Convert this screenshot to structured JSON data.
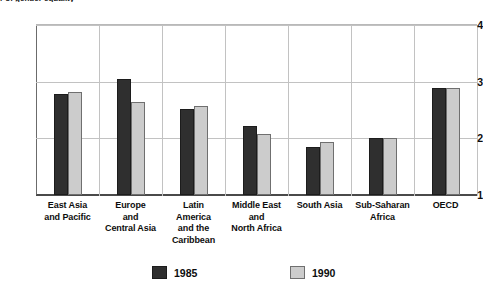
{
  "title_clipped": "r of gender equality",
  "legend": {
    "position": "bottom",
    "entries": [
      {
        "name": "1985",
        "swatch": "dark-gray",
        "color": "#2f2f2f"
      },
      {
        "name": "1990",
        "swatch": "light-gray",
        "color": "#cccccc"
      }
    ]
  },
  "axis": {
    "y_ticks": [
      "4",
      "3",
      "2",
      "1"
    ],
    "y_min": 1,
    "y_max": 4
  },
  "chart_data": {
    "type": "bar",
    "title": "r of gender equality",
    "xlabel": "",
    "ylabel": "",
    "ylim": [
      1,
      4
    ],
    "yticks": [
      1,
      2,
      3,
      4
    ],
    "grid": true,
    "legend_position": "bottom",
    "categories": [
      "East Asia and Pacific",
      "Europe and Central Asia",
      "Latin America and the Caribbean",
      "Middle East and North Africa",
      "South Asia",
      "Sub-Saharan Africa",
      "OECD"
    ],
    "category_lines": [
      [
        "East Asia",
        "and Pacific"
      ],
      [
        "Europe",
        "and",
        "Central Asia"
      ],
      [
        "Latin",
        "America",
        "and the",
        "Caribbean"
      ],
      [
        "Middle East",
        "and",
        "North Africa"
      ],
      [
        "South Asia"
      ],
      [
        "Sub-Saharan",
        "Africa"
      ],
      [
        "OECD"
      ]
    ],
    "series": [
      {
        "name": "1985",
        "color": "#2f2f2f",
        "values": [
          2.78,
          3.05,
          2.52,
          2.22,
          1.85,
          2.0,
          2.88
        ]
      },
      {
        "name": "1990",
        "color": "#cccccc",
        "values": [
          2.81,
          2.65,
          2.57,
          2.08,
          1.94,
          2.0,
          2.88
        ]
      }
    ]
  }
}
